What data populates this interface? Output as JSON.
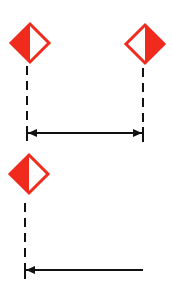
{
  "diagram": {
    "colors": {
      "marker_red": "#f02a1c",
      "marker_white": "#ffffff",
      "line": "#111111",
      "background": "#ffffff"
    },
    "panels": [
      {
        "name": "top-panel",
        "markers": [
          {
            "name": "left-marker",
            "cx": 30,
            "cy": 43,
            "half": 19,
            "filled_side": "left"
          },
          {
            "name": "right-marker",
            "cx": 145,
            "cy": 44,
            "half": 19,
            "filled_side": "right"
          }
        ],
        "dashed_lines": [
          {
            "x": 27,
            "y1": 66,
            "y2": 141
          },
          {
            "x": 143,
            "y1": 68,
            "y2": 142
          }
        ],
        "arrow": {
          "type": "double",
          "y": 133,
          "x1": 27,
          "x2": 143
        }
      },
      {
        "name": "bottom-panel",
        "markers": [
          {
            "name": "bottom-marker",
            "cx": 29,
            "cy": 174,
            "half": 19,
            "filled_side": "left"
          }
        ],
        "dashed_lines": [
          {
            "x": 25,
            "y1": 203,
            "y2": 279
          }
        ],
        "arrow": {
          "type": "single-left",
          "y": 270,
          "x1": 25,
          "x2": 143
        }
      }
    ]
  }
}
